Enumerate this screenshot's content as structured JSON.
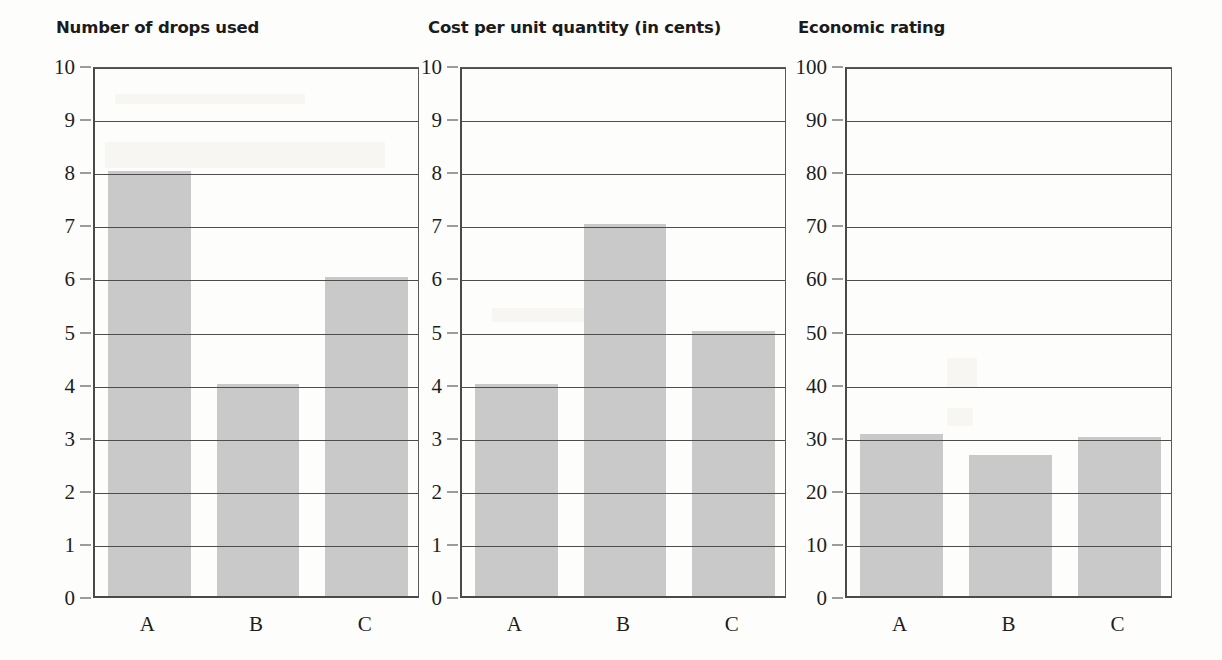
{
  "chart_data": [
    {
      "type": "bar",
      "title": "Number of drops used",
      "categories": [
        "A",
        "B",
        "C"
      ],
      "values": [
        8,
        4,
        6
      ],
      "xlabel": "",
      "ylabel": "",
      "ylim": [
        0,
        10
      ],
      "ytick_step": 1,
      "yticks": [
        "0",
        "1",
        "2",
        "3",
        "4",
        "5",
        "6",
        "7",
        "8",
        "9",
        "10"
      ],
      "grid": true,
      "legend": "none",
      "bar_color": "#c9c9c9"
    },
    {
      "type": "bar",
      "title": "Cost per unit quantity (in cents)",
      "categories": [
        "A",
        "B",
        "C"
      ],
      "values": [
        4,
        7,
        5
      ],
      "xlabel": "",
      "ylabel": "",
      "ylim": [
        0,
        10
      ],
      "ytick_step": 1,
      "yticks": [
        "0",
        "1",
        "2",
        "3",
        "4",
        "5",
        "6",
        "7",
        "8",
        "9",
        "10"
      ],
      "grid": true,
      "legend": "none",
      "bar_color": "#c9c9c9"
    },
    {
      "type": "bar",
      "title": "Economic rating",
      "categories": [
        "A",
        "B",
        "C"
      ],
      "values": [
        30.5,
        26.5,
        30
      ],
      "xlabel": "",
      "ylabel": "",
      "ylim": [
        0,
        100
      ],
      "ytick_step": 10,
      "yticks": [
        "0",
        "10",
        "20",
        "30",
        "40",
        "50",
        "60",
        "70",
        "80",
        "90",
        "100"
      ],
      "grid": true,
      "legend": "none",
      "bar_color": "#c9c9c9"
    }
  ]
}
